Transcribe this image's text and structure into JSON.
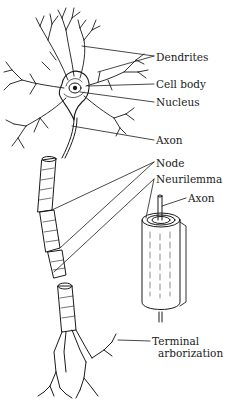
{
  "figure": {
    "colors": {
      "ink": "#1a1a1a",
      "background": "#ffffff"
    },
    "labels": [
      {
        "id": "dendrites",
        "text": "Dendrites",
        "x": 156,
        "y": 51
      },
      {
        "id": "cell-body",
        "text": "Cell body",
        "x": 156,
        "y": 78
      },
      {
        "id": "nucleus",
        "text": "Nucleus",
        "x": 156,
        "y": 96
      },
      {
        "id": "axon",
        "text": "Axon",
        "x": 156,
        "y": 134
      },
      {
        "id": "node",
        "text": "Node",
        "x": 156,
        "y": 157
      },
      {
        "id": "neurilemma",
        "text": "Neurilemma",
        "x": 156,
        "y": 173
      },
      {
        "id": "axon-inset",
        "text": "Axon",
        "x": 188,
        "y": 192
      },
      {
        "id": "terminal-1",
        "text": "Terminal",
        "x": 152,
        "y": 335
      },
      {
        "id": "terminal-2",
        "text": "arborization",
        "x": 158,
        "y": 347
      }
    ]
  }
}
